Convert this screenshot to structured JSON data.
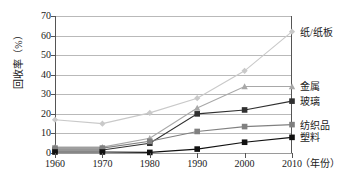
{
  "chart_data": {
    "type": "line",
    "title": "",
    "xlabel": "（年份）",
    "ylabel": "回收率（%）",
    "categories": [
      "1960",
      "1970",
      "1980",
      "1990",
      "2000",
      "2010"
    ],
    "x": [
      1960,
      1970,
      1980,
      1990,
      2000,
      2010
    ],
    "xlim": [
      1960,
      2010
    ],
    "ylim": [
      0,
      70
    ],
    "yticks": [
      "0",
      "10",
      "20",
      "30",
      "40",
      "50",
      "60",
      "70"
    ],
    "ytick_values": [
      0,
      10,
      20,
      30,
      40,
      50,
      60,
      70
    ],
    "grid": true,
    "legend_position": "right-of-plot",
    "series": [
      {
        "name": "纸/纸板",
        "values": [
          17,
          15,
          20.5,
          28,
          42,
          62
        ],
        "color": "#c9c9c9",
        "marker": "diamond"
      },
      {
        "name": "金属",
        "values": [
          3,
          3,
          7.5,
          23,
          34,
          34
        ],
        "color": "#a8a8a8",
        "marker": "triangle"
      },
      {
        "name": "玻璃",
        "values": [
          1.5,
          1.5,
          5,
          20,
          22,
          26.5
        ],
        "color": "#303030",
        "marker": "square"
      },
      {
        "name": "纺织品",
        "values": [
          2.5,
          2.5,
          6,
          11,
          13.5,
          14.5
        ],
        "color": "#808080",
        "marker": "square"
      },
      {
        "name": "塑料",
        "values": [
          0.5,
          0.5,
          0.3,
          2,
          5.5,
          8
        ],
        "color": "#111111",
        "marker": "square"
      }
    ]
  },
  "axis": {
    "y_title": "回收率（%）",
    "x_unit": "（年份）"
  }
}
